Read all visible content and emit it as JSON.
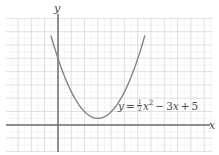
{
  "figure": {
    "title": "",
    "width": 219,
    "height": 155,
    "background": "#ffffff"
  },
  "labels": {
    "y_axis": "y",
    "x_axis": "x",
    "equation_parts": {
      "lhs": "y",
      "equals": "=",
      "coefficient_numerator": "1",
      "coefficient_denominator": "2",
      "quadratic_var": "x",
      "exponent": "2",
      "minus": "−",
      "linear_coefficient": "3",
      "linear_var": "x",
      "plus": "+",
      "constant": "5"
    },
    "equation_plain": "y = 1/2 x^2 - 3x + 5"
  },
  "colors": {
    "curve": "#848484",
    "axis": "#6e6e6e",
    "grid_major": "#dcdcdc",
    "grid_minor": "#efefef",
    "text": "#4d4d4d",
    "background": "#ffffff"
  },
  "chart_data": {
    "type": "line",
    "title": "",
    "xlabel": "x",
    "ylabel": "y",
    "grid": true,
    "legend": null,
    "annotations": [
      {
        "text": "y = 1/2 x^2 - 3x + 5",
        "x": 4.5,
        "y": 1.1
      }
    ],
    "axes": {
      "origin_px": [
        58,
        125
      ],
      "px_per_unit_x": 13.3,
      "px_per_unit_y": 13.3,
      "xlim": [
        -3.9,
        11.6
      ],
      "ylim": [
        -2.0,
        8.0
      ],
      "major_tick_step": 1,
      "minor_subdivisions": 2,
      "tick_labels_shown": false
    },
    "series": [
      {
        "name": "y = 1/2 x^2 - 3x + 5",
        "equation": "y = 0.5*x^2 - 3*x + 5",
        "vertex": [
          3,
          0.5
        ],
        "y_intercept": 5,
        "domain": [
          -0.52,
          6.52
        ],
        "color": "#848484",
        "x": [
          -0.52,
          0,
          0.5,
          1,
          1.5,
          2,
          2.5,
          3,
          3.5,
          4,
          4.5,
          5,
          5.5,
          6,
          6.52
        ],
        "values": [
          6.69,
          5,
          3.63,
          2.5,
          1.63,
          1,
          0.63,
          0.5,
          0.63,
          1,
          1.63,
          2.5,
          3.63,
          5,
          6.69
        ]
      }
    ]
  }
}
